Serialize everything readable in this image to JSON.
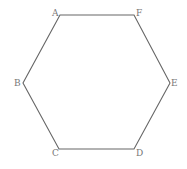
{
  "diagram": {
    "type": "regular-hexagon",
    "stroke_color": "#666666",
    "label_color": "#777777",
    "vertices": [
      {
        "name": "A",
        "x": 60,
        "y": 15,
        "label_x": 52,
        "label_y": 16
      },
      {
        "name": "B",
        "x": 23,
        "y": 83,
        "label_x": 14,
        "label_y": 86
      },
      {
        "name": "C",
        "x": 59,
        "y": 149,
        "label_x": 52,
        "label_y": 156
      },
      {
        "name": "D",
        "x": 134,
        "y": 149,
        "label_x": 136,
        "label_y": 156
      },
      {
        "name": "E",
        "x": 170,
        "y": 83,
        "label_x": 171,
        "label_y": 86
      },
      {
        "name": "F",
        "x": 134,
        "y": 15,
        "label_x": 136,
        "label_y": 16
      }
    ],
    "edges": [
      [
        "A",
        "F"
      ],
      [
        "F",
        "E"
      ],
      [
        "E",
        "D"
      ],
      [
        "D",
        "C"
      ],
      [
        "C",
        "B"
      ],
      [
        "B",
        "A"
      ]
    ]
  }
}
